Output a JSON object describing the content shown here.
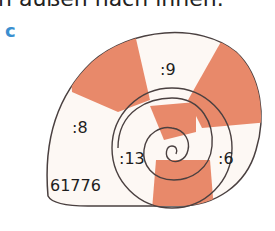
{
  "header": {
    "instruction_text": "n außen nach innen."
  },
  "exercise": {
    "label": "c",
    "start_number": "61776",
    "steps": [
      ":8",
      ":9",
      ":6",
      ":13"
    ],
    "colors": {
      "stripe": "#e8896a",
      "light": "#ffffff",
      "outline": "#4a4040",
      "label": "#3a8fd0"
    }
  }
}
